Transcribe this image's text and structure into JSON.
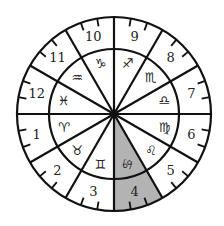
{
  "diagram": {
    "center": [
      114,
      114
    ],
    "outer_radius": 97,
    "inner_radius": 65,
    "shade_color": "#b3b3b3",
    "line_color": "#111111",
    "highlighted_house": 4,
    "highlighted_span_deg": [
      270,
      300
    ],
    "houses": [
      {
        "number": "1",
        "angle": 195,
        "sign": "♈",
        "sign_name": "aries"
      },
      {
        "number": "2",
        "angle": 225,
        "sign": "♉",
        "sign_name": "taurus"
      },
      {
        "number": "3",
        "angle": 255,
        "sign": "♊",
        "sign_name": "gemini"
      },
      {
        "number": "4",
        "angle": 285,
        "sign": "♋",
        "sign_name": "cancer",
        "highlighted": true
      },
      {
        "number": "5",
        "angle": 315,
        "sign": "♌",
        "sign_name": "leo"
      },
      {
        "number": "6",
        "angle": 345,
        "sign": "♍",
        "sign_name": "virgo"
      },
      {
        "number": "7",
        "angle": 15,
        "sign": "♎",
        "sign_name": "libra"
      },
      {
        "number": "8",
        "angle": 45,
        "sign": "♏",
        "sign_name": "scorpio"
      },
      {
        "number": "9",
        "angle": 75,
        "sign": "♐",
        "sign_name": "sagittarius"
      },
      {
        "number": "10",
        "angle": 105,
        "sign": "♑",
        "sign_name": "capricorn"
      },
      {
        "number": "11",
        "angle": 135,
        "sign": "♒",
        "sign_name": "aquarius"
      },
      {
        "number": "12",
        "angle": 165,
        "sign": "♓",
        "sign_name": "pisces"
      }
    ]
  }
}
